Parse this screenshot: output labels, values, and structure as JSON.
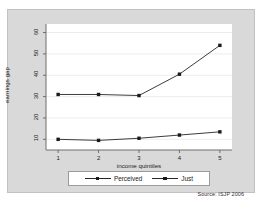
{
  "figure": {
    "source_note": "Source: ISJP 2006",
    "background_color": "#d9d9d9",
    "plot_background_color": "#ffffff",
    "line_color": "#262626",
    "marker_color": "#1a1a1a"
  },
  "chart_data": {
    "type": "line",
    "title": "",
    "xlabel": "income quintiles",
    "ylabel": "earnings gap",
    "x": [
      1,
      2,
      3,
      4,
      5
    ],
    "xticklabels": [
      "1",
      "2",
      "3",
      "4",
      "5"
    ],
    "yticklabels": [
      "10",
      "20",
      "30",
      "40",
      "50",
      "60"
    ],
    "yticks": [
      10,
      20,
      30,
      40,
      50,
      60
    ],
    "xlim": [
      0.7,
      5.3
    ],
    "ylim": [
      5,
      64
    ],
    "grid": "horizontal",
    "legend_position": "below-axes",
    "series": [
      {
        "name": "Perceived",
        "values": [
          31,
          31,
          30.5,
          40.5,
          54
        ]
      },
      {
        "name": "Just",
        "values": [
          10,
          9.5,
          10.5,
          12,
          13.5
        ]
      }
    ]
  }
}
